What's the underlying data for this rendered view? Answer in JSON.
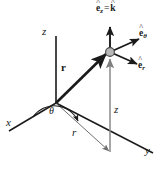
{
  "figure": {
    "type": "coordinate-axes-diagram",
    "background_color": "#ffffff",
    "line_color": "#1a1a1a",
    "thin_line_color": "#6e6e6e",
    "particle_fill": "#b8b8b8",
    "particle_stroke": "#4a4a4a"
  },
  "axes": [
    {
      "id": "z",
      "label": "z",
      "label_x": 43,
      "label_y": 28,
      "from": [
        56,
        103
      ],
      "to": [
        56,
        36
      ]
    },
    {
      "id": "x",
      "label": "x",
      "label_x": 7,
      "label_y": 121,
      "from": [
        56,
        103
      ],
      "to": [
        9,
        131
      ]
    },
    {
      "id": "y",
      "label": "y",
      "label_x": 146,
      "label_y": 148,
      "from": [
        56,
        103
      ],
      "to": [
        153,
        153
      ]
    }
  ],
  "vectors": [
    {
      "id": "r-position",
      "label": "r",
      "style": "bold",
      "label_x": 62,
      "label_y": 66,
      "from": [
        56,
        103
      ],
      "to": [
        108,
        51
      ]
    }
  ],
  "scalars": [
    {
      "id": "z-height",
      "label": "z",
      "label_x": 115,
      "label_y": 108
    },
    {
      "id": "r-radial",
      "label": "r",
      "label_x": 73,
      "label_y": 131
    }
  ],
  "angles": [
    {
      "id": "theta",
      "label": "θ",
      "label_x": 50,
      "label_y": 110
    }
  ],
  "unit_vectors": [
    {
      "id": "e-z-equals-k",
      "symbol": "e",
      "subscript": "z",
      "equals": "=",
      "second_symbol": "k",
      "accent": "^",
      "label_text": "ê_z = k̂",
      "label_x": 97,
      "label_y": 5,
      "from": [
        110,
        52
      ],
      "to": [
        110,
        26
      ]
    },
    {
      "id": "e-theta",
      "symbol": "e",
      "subscript": "θ",
      "accent": "^",
      "label_text": "ê_θ",
      "label_x": 140,
      "label_y": 30,
      "from": [
        110,
        52
      ],
      "to": [
        140,
        38
      ]
    },
    {
      "id": "e-r",
      "symbol": "e",
      "subscript": "r",
      "accent": "^",
      "label_text": "ê_r",
      "label_x": 139,
      "label_y": 62,
      "from": [
        110,
        52
      ],
      "to": [
        138,
        65
      ]
    }
  ],
  "particle": {
    "id": "point-p",
    "cx": 110,
    "cy": 52,
    "r": 4.4
  },
  "projection_lines": [
    {
      "id": "z-drop-line",
      "from": [
        110,
        152
      ],
      "to": [
        110,
        56
      ],
      "color": "#8a8a8a",
      "arrow": "end"
    },
    {
      "id": "r-projection",
      "from": [
        56,
        103
      ],
      "to": [
        110,
        152
      ],
      "color": "#6e6e6e",
      "arrow": "end"
    }
  ],
  "caption": {
    "text": ""
  }
}
